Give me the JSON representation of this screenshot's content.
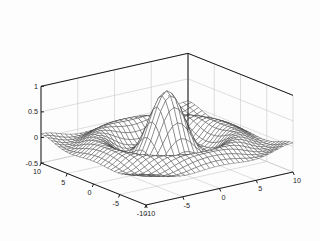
{
  "figure": {
    "background_color": "#fdfdfd",
    "axis_color": "#1a1a1a",
    "grid_color": "#c8c8c8",
    "mesh_color": "#3a3a3a",
    "face_color": "#ffffff"
  },
  "chart_data": {
    "type": "line",
    "plot_style": "3d-mesh-wireframe",
    "title": "",
    "xlabel": "",
    "ylabel": "",
    "zlabel": "",
    "function": "z = sin(r)/r, r = sqrt(x^2 + y^2)",
    "xlim": [
      -10,
      10
    ],
    "ylim": [
      -10,
      10
    ],
    "zlim": [
      -0.5,
      1
    ],
    "x_ticks": [
      -10,
      -5,
      0,
      5,
      10
    ],
    "y_ticks": [
      -10,
      -5,
      0,
      5,
      10
    ],
    "z_ticks": [
      -0.5,
      0,
      0.5,
      1
    ],
    "x_ticklabels": [
      "-10",
      "-5",
      "0",
      "5",
      "10"
    ],
    "y_ticklabels": [
      "10",
      "5",
      "0",
      "-5",
      "-10"
    ],
    "z_ticklabels": [
      "-0.5",
      "0",
      "0.5",
      "1"
    ],
    "grid": true,
    "legend": null,
    "mesh_resolution": 31,
    "peak_value": 1.0,
    "min_value": -0.22,
    "view": {
      "azimuth": -37.5,
      "elevation": 30
    },
    "annotations": []
  },
  "axes": {
    "z_axis": {
      "name": "z-axis",
      "ticks": [
        "1",
        "0.5",
        "0",
        "-0.5"
      ]
    },
    "y_axis": {
      "name": "y-axis",
      "ticks": [
        "10",
        "5",
        "0",
        "-5",
        "-10"
      ]
    },
    "x_axis": {
      "name": "x-axis",
      "ticks": [
        "-10",
        "-5",
        "0",
        "5",
        "10"
      ]
    }
  }
}
